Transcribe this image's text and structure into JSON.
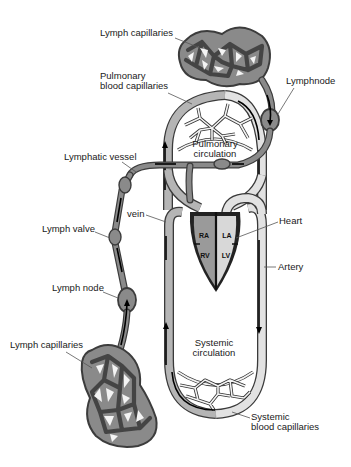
{
  "diagram": {
    "labels": {
      "lymph_capillaries_top": "Lymph capillaries",
      "pulmonary_capillaries_line1": "Pulmonary",
      "pulmonary_capillaries_line2": "blood capillaries",
      "lymph_node_top": "Lymphnode",
      "lymphatic_vessel": "Lymphatic vessel",
      "pulmonary_circulation_line1": "Pulmonary",
      "pulmonary_circulation_line2": "circulation",
      "vein": "vein",
      "heart": "Heart",
      "lymph_valve": "Lymph valve",
      "artery": "Artery",
      "lymph_node_bottom": "Lymph node",
      "lymph_capillaries_bottom": "Lymph capillaries",
      "systemic_circulation_line1": "Systemic",
      "systemic_circulation_line2": "circulation",
      "systemic_capillaries_line1": "Systemic",
      "systemic_capillaries_line2": "blood capillaries"
    },
    "heart_chambers": {
      "ra": "RA",
      "la": "LA",
      "rv": "RV",
      "lv": "LV"
    },
    "colors": {
      "background": "#ffffff",
      "outline": "#333333",
      "lymph": "#8a8a8a",
      "deoxygenated_blood": "#b5b5b5",
      "oxygenated_blood": "#e2e2e2",
      "heart_right": "#9a9a9a",
      "heart_left": "#d8d8d8",
      "arrows": "#000000"
    }
  }
}
